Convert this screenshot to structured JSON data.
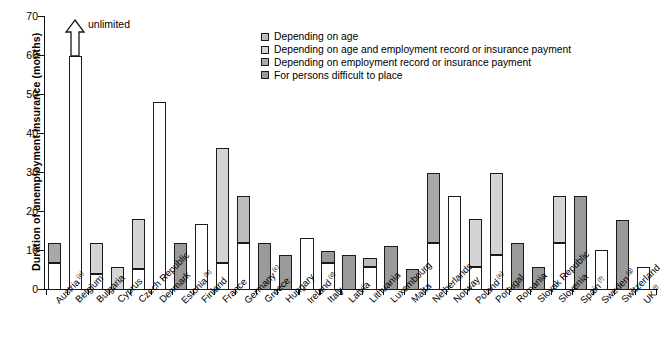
{
  "chart_data": {
    "type": "bar",
    "title": "",
    "xlabel": "",
    "ylabel": "Duration of unemployment insurance (months)",
    "ylim": [
      0,
      70
    ],
    "yticks": [
      0,
      10,
      20,
      30,
      40,
      50,
      60,
      70
    ],
    "grid": false,
    "stacked": true,
    "legend_position": "top-center",
    "annotation": "unlimited",
    "series": [
      {
        "name": "Depending on age",
        "color": "#bdbdbd"
      },
      {
        "name": "Depending on age and employment record or insurance payment",
        "color": "#d4d4d4"
      },
      {
        "name": "Depending on employment record or insurance payment",
        "color": "#a8a8a8"
      },
      {
        "name": "For persons difficult to place",
        "color": "#9a9a9a"
      }
    ],
    "categories": [
      "Austria",
      "Belgium",
      "Bulgaria",
      "Cyprus",
      "Czech Republic",
      "Denmark",
      "Estonia",
      "Finland",
      "France",
      "Germany",
      "Greece",
      "Hungary",
      "Ireland",
      "Italy",
      "Latvia",
      "Lithuania",
      "Luxembourg",
      "Malta",
      "Netherlands",
      "Norway",
      "Poland",
      "Portugal",
      "Romania",
      "Slovak Republic",
      "Slovenia",
      "Spain",
      "Sweden",
      "Switzerland",
      "UK"
    ],
    "category_footnotes": {
      "Austria": "(a)",
      "Estonia": "(b)",
      "Germany": "(c)",
      "Ireland": "(d)",
      "Poland": "(e)",
      "Spain": "(f)",
      "Sweden": "(g)",
      "UK": "(i)"
    },
    "bars": [
      {
        "category": "Austria",
        "total": 12,
        "base": 7,
        "top_series": "Depending on employment record or insurance payment"
      },
      {
        "category": "Belgium",
        "total": 60,
        "base": 60,
        "top_series": "none",
        "note": "unlimited"
      },
      {
        "category": "Bulgaria",
        "total": 12,
        "base": 4,
        "top_series": "Depending on age and employment record or insurance payment"
      },
      {
        "category": "Cyprus",
        "total": 6,
        "base": 6,
        "top_series": "Depending on age and employment record or insurance payment"
      },
      {
        "category": "Czech Republic",
        "total": 18.3,
        "base": 5.5,
        "top_series": "Depending on age and employment record or insurance payment"
      },
      {
        "category": "Denmark",
        "total": 48.3,
        "base": 48.3,
        "top_series": "none"
      },
      {
        "category": "Estonia",
        "total": 12,
        "base": 12,
        "top_series": "For persons difficult to place"
      },
      {
        "category": "Finland",
        "total": 17,
        "base": 17,
        "top_series": "none"
      },
      {
        "category": "France",
        "total": 36.3,
        "base": 7,
        "top_series": "Depending on age and employment record or insurance payment"
      },
      {
        "category": "Germany",
        "total": 24,
        "base": 12,
        "top_series": "Depending on age"
      },
      {
        "category": "Greece",
        "total": 12,
        "base": 12,
        "top_series": "For persons difficult to place"
      },
      {
        "category": "Hungary",
        "total": 9,
        "base": 9,
        "top_series": "For persons difficult to place"
      },
      {
        "category": "Ireland",
        "total": 13.3,
        "base": 13.3,
        "top_series": "none"
      },
      {
        "category": "Italy",
        "total": 10,
        "base": 7,
        "top_series": "For persons difficult to place"
      },
      {
        "category": "Latvia",
        "total": 9,
        "base": 9,
        "top_series": "For persons difficult to place"
      },
      {
        "category": "Lithuania",
        "total": 8.3,
        "base": 6,
        "top_series": "Depending on age"
      },
      {
        "category": "Luxembourg",
        "total": 11.3,
        "base": 11.3,
        "top_series": "For persons difficult to place"
      },
      {
        "category": "Malta",
        "total": 5.5,
        "base": 5.5,
        "top_series": "For persons difficult to place"
      },
      {
        "category": "Netherlands",
        "total": 30,
        "base": 12,
        "top_series": "Depending on employment record or insurance payment"
      },
      {
        "category": "Norway",
        "total": 24,
        "base": 24,
        "top_series": "none"
      },
      {
        "category": "Poland",
        "total": 18.3,
        "base": 6,
        "top_series": "Depending on age and employment record or insurance payment"
      },
      {
        "category": "Portugal",
        "total": 30,
        "base": 9,
        "top_series": "Depending on age and employment record or insurance payment"
      },
      {
        "category": "Romania",
        "total": 12,
        "base": 12,
        "top_series": "For persons difficult to place"
      },
      {
        "category": "Slovak Republic",
        "total": 6,
        "base": 6,
        "top_series": "For persons difficult to place"
      },
      {
        "category": "Slovenia",
        "total": 24,
        "base": 12,
        "top_series": "Depending on age and employment record or insurance payment"
      },
      {
        "category": "Spain",
        "total": 24,
        "base": 24,
        "top_series": "For persons difficult to place"
      },
      {
        "category": "Sweden",
        "total": 10.3,
        "base": 10.3,
        "top_series": "none"
      },
      {
        "category": "Switzerland",
        "total": 18,
        "base": 18,
        "top_series": "For persons difficult to place"
      },
      {
        "category": "UK",
        "total": 6,
        "base": 6,
        "top_series": "none"
      }
    ]
  },
  "axis": {
    "y_title": "Duration of unemployment insurance (months)",
    "y_ticks": [
      "0",
      "10",
      "20",
      "30",
      "40",
      "50",
      "60",
      "70"
    ]
  },
  "annotations": {
    "unlimited": "unlimited"
  },
  "legend": {
    "items": [
      {
        "label": "Depending on age",
        "swatch": "#bdbdbd"
      },
      {
        "label": "Depending on age and employment record or insurance payment",
        "swatch": "#d4d4d4"
      },
      {
        "label": "Depending on employment record or insurance payment",
        "swatch": "#a8a8a8"
      },
      {
        "label": "For persons difficult to place",
        "swatch": "#9a9a9a"
      }
    ]
  },
  "x_labels": [
    {
      "name": "Austria",
      "fn": "(a)"
    },
    {
      "name": "Belgium",
      "fn": ""
    },
    {
      "name": "Bulgaria",
      "fn": ""
    },
    {
      "name": "Cyprus",
      "fn": ""
    },
    {
      "name": "Czech Republic",
      "fn": ""
    },
    {
      "name": "Denmark",
      "fn": ""
    },
    {
      "name": "Estonia",
      "fn": "(b)"
    },
    {
      "name": "Finland",
      "fn": ""
    },
    {
      "name": "France",
      "fn": ""
    },
    {
      "name": "Germany",
      "fn": "(c)"
    },
    {
      "name": "Greece",
      "fn": ""
    },
    {
      "name": "Hungary",
      "fn": ""
    },
    {
      "name": "Ireland",
      "fn": "(d)"
    },
    {
      "name": "Italy",
      "fn": ""
    },
    {
      "name": "Latvia",
      "fn": ""
    },
    {
      "name": "Lithuania",
      "fn": ""
    },
    {
      "name": "Luxembourg",
      "fn": ""
    },
    {
      "name": "Malta",
      "fn": ""
    },
    {
      "name": "Netherlands",
      "fn": ""
    },
    {
      "name": "Norway",
      "fn": ""
    },
    {
      "name": "Poland",
      "fn": "(e)"
    },
    {
      "name": "Portugal",
      "fn": ""
    },
    {
      "name": "Romania",
      "fn": ""
    },
    {
      "name": "Slovak Republic",
      "fn": ""
    },
    {
      "name": "Slovenia",
      "fn": ""
    },
    {
      "name": "Spain",
      "fn": "(f)"
    },
    {
      "name": "Sweden",
      "fn": "(g)"
    },
    {
      "name": "Switzerland",
      "fn": ""
    },
    {
      "name": "UK",
      "fn": "(i)"
    }
  ]
}
